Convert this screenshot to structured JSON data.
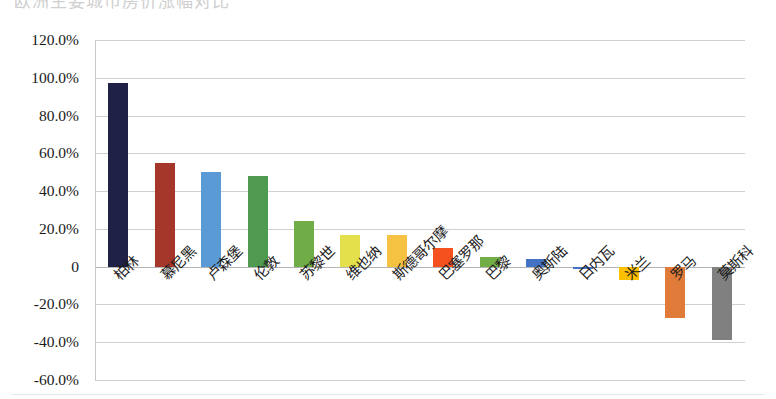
{
  "title_fragment": "欧洲主要城市房价涨幅对比",
  "chart_data": {
    "type": "bar",
    "title": "",
    "xlabel": "",
    "ylabel": "",
    "ylim": [
      -60,
      120
    ],
    "ytick_labels": [
      "120.0%",
      "100.0%",
      "80.0%",
      "60.0%",
      "40.0%",
      "20.0%",
      "0",
      "-20.0%",
      "-40.0%",
      "-60.0%"
    ],
    "ytick_values": [
      120,
      100,
      80,
      60,
      40,
      20,
      0,
      -20,
      -40,
      -60
    ],
    "grid": true,
    "legend": "none",
    "categories": [
      "柏林",
      "慕尼黑",
      "卢森堡",
      "伦敦",
      "苏黎世",
      "维也纳",
      "斯德哥尔摩",
      "巴塞罗那",
      "巴黎",
      "奥斯陆",
      "日内瓦",
      "米兰",
      "罗马",
      "莫斯科"
    ],
    "values": [
      97.0,
      55.0,
      50.0,
      48.0,
      24.0,
      17.0,
      17.0,
      10.0,
      5.0,
      4.0,
      -1.0,
      -7.0,
      -27.0,
      -39.0
    ],
    "colors": [
      "#1F2147",
      "#A5372A",
      "#5B9BD5",
      "#4E9A51",
      "#70AD47",
      "#E3E04B",
      "#F5C242",
      "#F4511E",
      "#70AD47",
      "#4472C4",
      "#4472C4",
      "#FFC000",
      "#E07B39",
      "#808080"
    ]
  }
}
